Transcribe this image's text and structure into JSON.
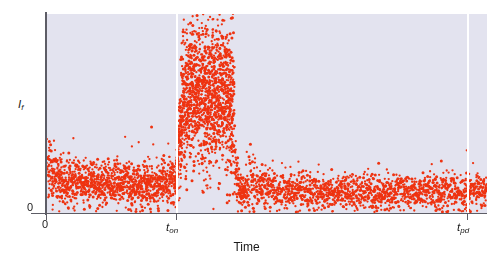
{
  "chart_data": {
    "type": "scatter",
    "title": "",
    "xlabel": "Time",
    "ylabel": "I_f",
    "ylabel_base": "I",
    "ylabel_sub": "f",
    "xlim": [
      0,
      1
    ],
    "ylim": [
      0,
      1
    ],
    "grid": false,
    "legend": null,
    "point_color": "#ee3311",
    "plot_background": "#e3e3ef",
    "axis_color": "#5d5d66",
    "marker_line_color": "#ffffff",
    "xticks": [
      {
        "label": "0",
        "value": 0.0
      },
      {
        "label": "t",
        "sub": "on",
        "value": 0.294
      },
      {
        "label": "t",
        "sub": "pd",
        "value": 0.955
      }
    ],
    "yticks": [
      {
        "label": "0",
        "value": 0.0
      }
    ],
    "marker_lines": [
      {
        "name": "t_on",
        "value": 0.294
      },
      {
        "name": "t_pd",
        "value": 0.955
      }
    ],
    "annotations": [
      {
        "text": "Time",
        "role": "x-axis-title"
      },
      {
        "text": "I",
        "role": "y-axis-title"
      }
    ],
    "segments": [
      {
        "name": "pre-activation-baseline",
        "x_range": [
          0.0,
          0.294
        ],
        "mean_level": 0.15,
        "noise": 0.055,
        "n_points": 1150,
        "description": "low fluorescence baseline before t_on"
      },
      {
        "name": "activated-burst",
        "x_range": [
          0.294,
          0.425
        ],
        "mean_level": 0.58,
        "noise": 0.185,
        "n_points": 1500,
        "description": "high intensity emission burst after photoactivation at t_on"
      },
      {
        "name": "photobleach-decay",
        "x_range": [
          0.425,
          0.452
        ],
        "mean_level": 0.28,
        "noise": 0.16,
        "n_points": 120,
        "description": "sharp decay edge to dark state"
      },
      {
        "name": "post-bleach-baseline",
        "x_range": [
          0.452,
          1.0
        ],
        "mean_level": 0.105,
        "noise": 0.045,
        "n_points": 1500,
        "description": "low dark-state baseline after photobleaching through t_pd"
      }
    ]
  }
}
